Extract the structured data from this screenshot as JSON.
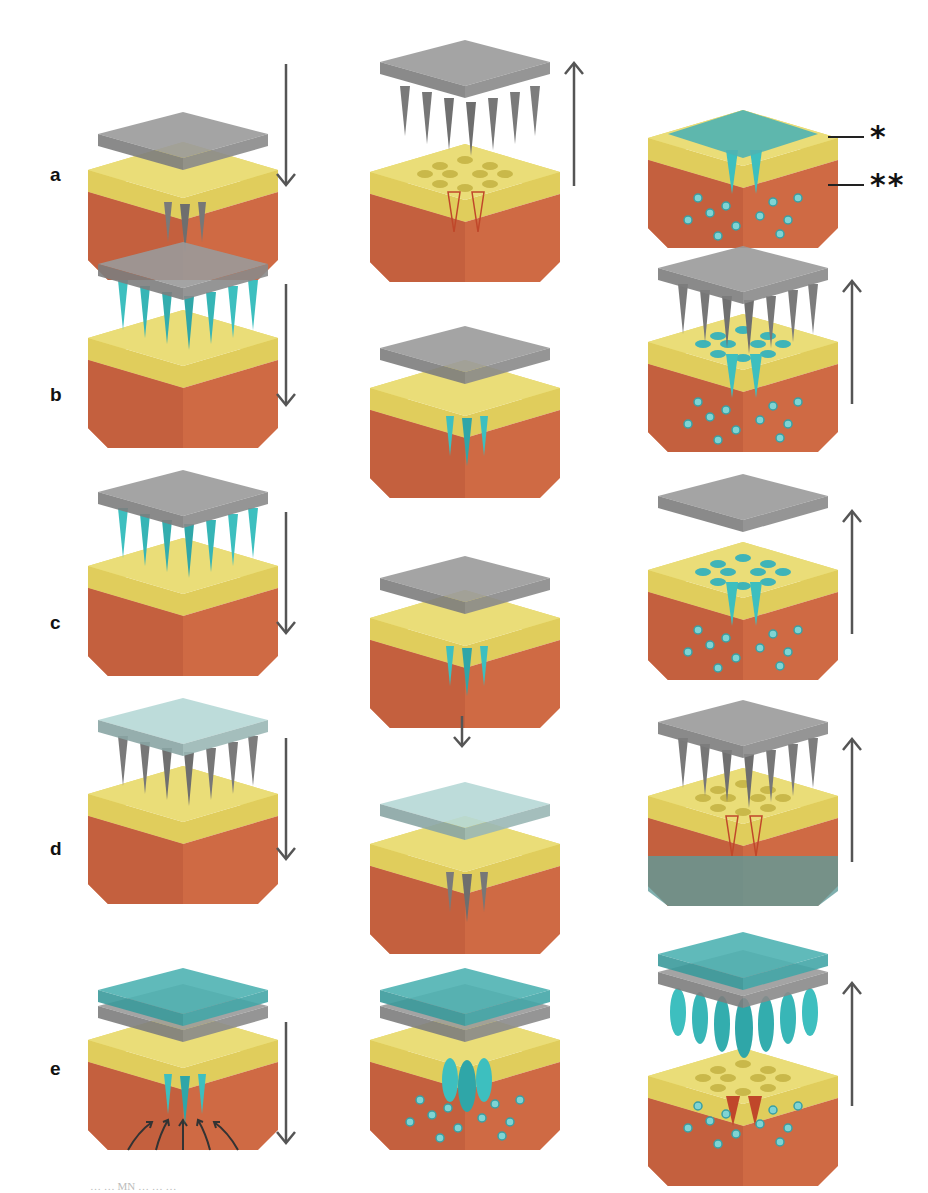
{
  "figure": {
    "rows": [
      {
        "label": "a",
        "panels": [
          {
            "state": "inserting",
            "needle": "solid-gray",
            "patch": "gray",
            "arrow": "down"
          },
          {
            "state": "removed-above",
            "needle": "solid-gray",
            "patch": "gray",
            "arrow": "up",
            "pores": true,
            "channels": true
          },
          {
            "state": "coated-skin",
            "needle": "none",
            "patch": "cyan-film",
            "dots": true,
            "cyan_spikes": 2
          }
        ]
      },
      {
        "label": "b",
        "panels": [
          {
            "state": "above",
            "needle": "cyan-tip",
            "patch": "gray",
            "arrow": "down"
          },
          {
            "state": "inserted",
            "needle": "cyan-tip",
            "patch": "gray"
          },
          {
            "state": "removed-above",
            "needle": "gray",
            "patch": "gray",
            "arrow": "up",
            "pores": "cyan",
            "dots": true,
            "cyan_spikes": 2
          }
        ]
      },
      {
        "label": "c",
        "panels": [
          {
            "state": "above",
            "needle": "cyan-tip",
            "patch": "gray",
            "arrow": "down"
          },
          {
            "state": "inserted",
            "needle": "cyan-tip",
            "patch": "gray"
          },
          {
            "state": "patch-only-above",
            "needle": "none",
            "patch": "gray",
            "arrow": "up",
            "pores": "cyan",
            "dots": true,
            "cyan_spikes": 2
          }
        ]
      },
      {
        "label": "d",
        "panels": [
          {
            "state": "above",
            "needle": "gray-hollow",
            "patch": "light-cyan",
            "arrow": "down"
          },
          {
            "state": "inserted",
            "needle": "gray-hollow",
            "patch": "light-cyan",
            "small_arrow": "down"
          },
          {
            "state": "removed-above",
            "needle": "gray",
            "patch": "gray",
            "arrow": "up",
            "pores": true,
            "channels": true,
            "cyan_band": true
          }
        ]
      },
      {
        "label": "e",
        "panels": [
          {
            "state": "inserted-reservoir",
            "needle": "cyan",
            "patch": "cyan-reservoir",
            "arrow": "down",
            "fluid_arrows": true
          },
          {
            "state": "swollen-inserted",
            "needle": "cyan-swollen",
            "patch": "cyan-reservoir",
            "dots": true
          },
          {
            "state": "swollen-removed",
            "needle": "cyan-swollen",
            "patch": "cyan-reservoir",
            "arrow": "up",
            "pores": true,
            "dots": true,
            "channels": true
          }
        ]
      }
    ],
    "callouts": [
      {
        "mark": "*",
        "target": "stratum-corneum-layer"
      },
      {
        "mark": "**",
        "target": "dermis-layer"
      }
    ],
    "caption_partial": "… … MN … … …"
  },
  "colors": {
    "skin_top": "#e8d96a",
    "skin_top_side": "#ddc95a",
    "dermis": "#cf6a44",
    "dermis_dark": "#b9573a",
    "patch_gray": "#8c8c8c",
    "patch_gray_dark": "#6b6b6b",
    "cyan": "#3dbfbf",
    "cyan_dark": "#2a8f93",
    "arrow": "#555555",
    "label": "#111111"
  }
}
